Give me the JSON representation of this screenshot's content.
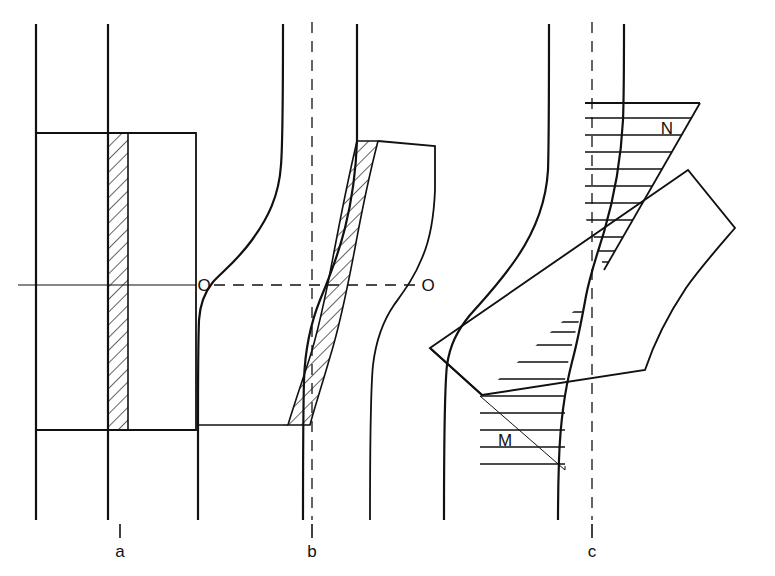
{
  "figure": {
    "type": "technical-line-diagram",
    "background_color": "#ffffff",
    "line_color": "#111111",
    "hatch_color": "#111111",
    "width": 775,
    "height": 576
  },
  "panels": [
    {
      "id": "a",
      "label": "a",
      "label_x": 120,
      "label_y": 552,
      "tick_x": 120,
      "tick_y_top": 524,
      "tick_y_bottom": 538,
      "stage": "undeformed",
      "hatched_band": "vertical-straight"
    },
    {
      "id": "b",
      "label": "b",
      "label_x": 312,
      "label_y": 552,
      "tick_x": 312,
      "tick_y_top": 524,
      "tick_y_bottom": 538,
      "stage": "partially-deformed",
      "hatched_band": "S-curved"
    },
    {
      "id": "c",
      "label": "c",
      "label_x": 592,
      "label_y": 552,
      "tick_x": 592,
      "tick_y_top": 524,
      "tick_y_bottom": 538,
      "stage": "fully-sheared",
      "hatched_band": "bow-tie-wedges"
    }
  ],
  "axis_labels": [
    {
      "name": "origin-left",
      "text": "O",
      "x": 204,
      "y": 289
    },
    {
      "name": "origin-right",
      "text": "O",
      "x": 428,
      "y": 289
    }
  ],
  "region_labels": [
    {
      "name": "region-n",
      "text": "N",
      "x": 667,
      "y": 134
    },
    {
      "name": "region-m",
      "text": "M",
      "x": 505,
      "y": 446
    }
  ],
  "centerlines": {
    "horizontal_solid": {
      "y": 285,
      "x_start": 18,
      "x_end": 196
    },
    "horizontal_dashed": {
      "y": 285,
      "x_start": 214,
      "x_end": 420
    },
    "vertical_dashed_b": {
      "x": 312,
      "y_start": 22,
      "y_end": 520
    },
    "vertical_dashed_c": {
      "x": 592,
      "y_start": 22,
      "y_end": 520
    }
  },
  "geometry": {
    "panel_a": {
      "roll_left_x": 36,
      "roll_right_x": 108,
      "roll_y_top": 24,
      "roll_y_bottom": 520,
      "block_left_x": 36,
      "block_right_x": 196,
      "block_y_top": 133,
      "block_y_bottom": 430,
      "hatch_left_x": 108,
      "hatch_right_x": 128
    },
    "panel_b": {
      "roll_y_top": 24,
      "roll_y_bottom": 520,
      "block_y_top": 141,
      "block_y_bottom": 425,
      "hatch_type": "s-curve-band"
    },
    "panel_c": {
      "roll_y_top": 24,
      "roll_y_bottom": 520,
      "bar_rotation_deg": 38,
      "hatch_type": "opposed-wedges"
    }
  },
  "colors": {
    "stroke": "#111111",
    "hatch": "#111111",
    "background": "#ffffff"
  }
}
